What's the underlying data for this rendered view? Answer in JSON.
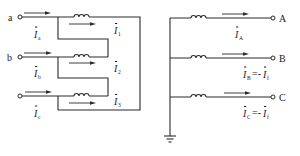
{
  "diagram": {
    "left_circuit": {
      "terminals": [
        {
          "label": "a"
        },
        {
          "label": "b"
        },
        {
          "label": "c"
        }
      ],
      "input_currents": [
        {
          "symbol": "I",
          "subscript": "a"
        },
        {
          "symbol": "I",
          "subscript": "b"
        },
        {
          "symbol": "I",
          "subscript": "c"
        }
      ],
      "winding_currents": [
        {
          "symbol": "I",
          "subscript": "1"
        },
        {
          "symbol": "I",
          "subscript": "2"
        },
        {
          "symbol": "I",
          "subscript": "3"
        }
      ]
    },
    "right_circuit": {
      "terminals": [
        {
          "label": "A"
        },
        {
          "label": "B"
        },
        {
          "label": "C"
        }
      ],
      "currents": [
        {
          "symbol": "I",
          "subscript": "A",
          "rhs": ""
        },
        {
          "symbol": "I",
          "subscript": "B",
          "eq": "=-",
          "rhs_symbol": "I",
          "rhs_subscript": "f"
        },
        {
          "symbol": "I",
          "subscript": "C",
          "eq": "=-",
          "rhs_symbol": "I",
          "rhs_subscript": "f"
        }
      ],
      "ground_symbol": "ground-icon"
    },
    "colors": {
      "line": "#2b2b2b",
      "background": "#ffffff"
    }
  }
}
